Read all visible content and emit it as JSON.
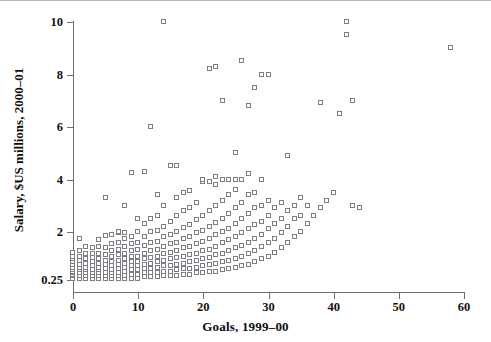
{
  "figure": {
    "kind": "scatter-plot",
    "background_color": "#ffffff",
    "marker_color": "#7d7d84",
    "marker_fill": "#ffffff",
    "axis_color": "#6f6f6f"
  },
  "axes": {
    "x_title": "Goals, 1999–00",
    "y_title": "Salary, $US millions, 2000–01",
    "x_ticks": [
      "0",
      "10",
      "20",
      "30",
      "40",
      "50",
      "60"
    ],
    "y_ticks": [
      "0.25",
      "2",
      "4",
      "6",
      "8",
      "10"
    ]
  },
  "chart_data": {
    "type": "scatter",
    "title": "",
    "xlabel": "Goals, 1999–00",
    "ylabel": "Salary, $US millions, 2000–01",
    "xlim": [
      0,
      60
    ],
    "ylim": [
      0.25,
      10
    ],
    "xticks": [
      0,
      10,
      20,
      30,
      40,
      50,
      60
    ],
    "yticks": [
      0.25,
      2,
      4,
      6,
      8,
      10
    ],
    "y_axis_note": "broken/compressed axis: 0.25 baseline then linear 2 to 10",
    "grid": false,
    "legend": false,
    "marker": "open-square",
    "series": [
      {
        "name": "players",
        "points": [
          [
            0,
            0.3
          ],
          [
            0,
            0.4
          ],
          [
            0,
            0.45
          ],
          [
            0,
            0.5
          ],
          [
            0,
            0.55
          ],
          [
            0,
            0.6
          ],
          [
            0,
            0.7
          ],
          [
            0,
            0.8
          ],
          [
            0,
            0.9
          ],
          [
            0,
            1.0
          ],
          [
            0,
            1.1
          ],
          [
            0,
            1.25
          ],
          [
            1,
            0.3
          ],
          [
            1,
            0.4
          ],
          [
            1,
            0.5
          ],
          [
            1,
            0.6
          ],
          [
            1,
            0.7
          ],
          [
            1,
            0.8
          ],
          [
            1,
            0.95
          ],
          [
            1,
            1.1
          ],
          [
            1,
            1.3
          ],
          [
            1,
            1.75
          ],
          [
            2,
            0.3
          ],
          [
            2,
            0.4
          ],
          [
            2,
            0.5
          ],
          [
            2,
            0.6
          ],
          [
            2,
            0.7
          ],
          [
            2,
            0.85
          ],
          [
            2,
            1.0
          ],
          [
            2,
            1.2
          ],
          [
            2,
            1.45
          ],
          [
            3,
            0.3
          ],
          [
            3,
            0.4
          ],
          [
            3,
            0.5
          ],
          [
            3,
            0.6
          ],
          [
            3,
            0.75
          ],
          [
            3,
            0.9
          ],
          [
            3,
            1.05
          ],
          [
            3,
            1.2
          ],
          [
            3,
            1.4
          ],
          [
            4,
            0.3
          ],
          [
            4,
            0.4
          ],
          [
            4,
            0.5
          ],
          [
            4,
            0.6
          ],
          [
            4,
            0.7
          ],
          [
            4,
            0.85
          ],
          [
            4,
            1.0
          ],
          [
            4,
            1.2
          ],
          [
            4,
            1.45
          ],
          [
            4,
            1.7
          ],
          [
            5,
            0.3
          ],
          [
            5,
            0.4
          ],
          [
            5,
            0.5
          ],
          [
            5,
            0.65
          ],
          [
            5,
            0.8
          ],
          [
            5,
            0.95
          ],
          [
            5,
            1.15
          ],
          [
            5,
            1.4
          ],
          [
            5,
            1.85
          ],
          [
            5,
            3.3
          ],
          [
            6,
            0.3
          ],
          [
            6,
            0.4
          ],
          [
            6,
            0.5
          ],
          [
            6,
            0.6
          ],
          [
            6,
            0.75
          ],
          [
            6,
            0.9
          ],
          [
            6,
            1.1
          ],
          [
            6,
            1.3
          ],
          [
            6,
            1.55
          ],
          [
            6,
            1.9
          ],
          [
            7,
            0.3
          ],
          [
            7,
            0.4
          ],
          [
            7,
            0.5
          ],
          [
            7,
            0.65
          ],
          [
            7,
            0.8
          ],
          [
            7,
            0.95
          ],
          [
            7,
            1.15
          ],
          [
            7,
            1.35
          ],
          [
            7,
            1.6
          ],
          [
            7,
            1.95
          ],
          [
            7,
            2.0
          ],
          [
            8,
            0.3
          ],
          [
            8,
            0.4
          ],
          [
            8,
            0.55
          ],
          [
            8,
            0.7
          ],
          [
            8,
            0.85
          ],
          [
            8,
            1.0
          ],
          [
            8,
            1.2
          ],
          [
            8,
            1.45
          ],
          [
            8,
            1.75
          ],
          [
            8,
            1.95
          ],
          [
            8,
            3.0
          ],
          [
            9,
            0.3
          ],
          [
            9,
            0.45
          ],
          [
            9,
            0.6
          ],
          [
            9,
            0.75
          ],
          [
            9,
            0.9
          ],
          [
            9,
            1.1
          ],
          [
            9,
            1.3
          ],
          [
            9,
            1.55
          ],
          [
            9,
            1.8
          ],
          [
            9,
            4.25
          ],
          [
            10,
            0.3
          ],
          [
            10,
            0.45
          ],
          [
            10,
            0.6
          ],
          [
            10,
            0.75
          ],
          [
            10,
            0.9
          ],
          [
            10,
            1.1
          ],
          [
            10,
            1.35
          ],
          [
            10,
            1.6
          ],
          [
            10,
            2.0
          ],
          [
            10,
            2.5
          ],
          [
            11,
            0.35
          ],
          [
            11,
            0.5
          ],
          [
            11,
            0.65
          ],
          [
            11,
            0.8
          ],
          [
            11,
            1.0
          ],
          [
            11,
            1.2
          ],
          [
            11,
            1.5
          ],
          [
            11,
            1.8
          ],
          [
            11,
            2.3
          ],
          [
            11,
            4.3
          ],
          [
            12,
            0.35
          ],
          [
            12,
            0.5
          ],
          [
            12,
            0.65
          ],
          [
            12,
            0.85
          ],
          [
            12,
            1.05
          ],
          [
            12,
            1.3
          ],
          [
            12,
            1.6
          ],
          [
            12,
            2.0
          ],
          [
            12,
            2.5
          ],
          [
            12,
            6.0
          ],
          [
            13,
            0.35
          ],
          [
            13,
            0.5
          ],
          [
            13,
            0.7
          ],
          [
            13,
            0.9
          ],
          [
            13,
            1.1
          ],
          [
            13,
            1.35
          ],
          [
            13,
            1.65
          ],
          [
            13,
            2.05
          ],
          [
            13,
            2.6
          ],
          [
            13,
            3.4
          ],
          [
            14,
            0.4
          ],
          [
            14,
            0.55
          ],
          [
            14,
            0.75
          ],
          [
            14,
            0.95
          ],
          [
            14,
            1.2
          ],
          [
            14,
            1.45
          ],
          [
            14,
            1.8
          ],
          [
            14,
            2.2
          ],
          [
            14,
            3.0
          ],
          [
            14,
            10.0
          ],
          [
            15,
            0.4
          ],
          [
            15,
            0.55
          ],
          [
            15,
            0.75
          ],
          [
            15,
            1.0
          ],
          [
            15,
            1.25
          ],
          [
            15,
            1.55
          ],
          [
            15,
            1.9
          ],
          [
            15,
            2.4
          ],
          [
            15,
            4.5
          ],
          [
            16,
            0.4
          ],
          [
            16,
            0.6
          ],
          [
            16,
            0.8
          ],
          [
            16,
            1.05
          ],
          [
            16,
            1.3
          ],
          [
            16,
            1.6
          ],
          [
            16,
            2.0
          ],
          [
            16,
            2.6
          ],
          [
            16,
            3.3
          ],
          [
            16,
            4.5
          ],
          [
            17,
            0.45
          ],
          [
            17,
            0.65
          ],
          [
            17,
            0.85
          ],
          [
            17,
            1.1
          ],
          [
            17,
            1.4
          ],
          [
            17,
            1.75
          ],
          [
            17,
            2.15
          ],
          [
            17,
            2.8
          ],
          [
            17,
            3.5
          ],
          [
            18,
            0.45
          ],
          [
            18,
            0.65
          ],
          [
            18,
            0.9
          ],
          [
            18,
            1.15
          ],
          [
            18,
            1.45
          ],
          [
            18,
            1.8
          ],
          [
            18,
            2.25
          ],
          [
            18,
            2.9
          ],
          [
            18,
            3.55
          ],
          [
            19,
            0.5
          ],
          [
            19,
            0.7
          ],
          [
            19,
            0.95
          ],
          [
            19,
            1.2
          ],
          [
            19,
            1.55
          ],
          [
            19,
            1.95
          ],
          [
            19,
            2.45
          ],
          [
            19,
            3.1
          ],
          [
            20,
            0.5
          ],
          [
            20,
            0.75
          ],
          [
            20,
            1.0
          ],
          [
            20,
            1.3
          ],
          [
            20,
            1.65
          ],
          [
            20,
            2.05
          ],
          [
            20,
            2.6
          ],
          [
            20,
            3.9
          ],
          [
            20,
            4.0
          ],
          [
            21,
            0.55
          ],
          [
            21,
            0.8
          ],
          [
            21,
            1.05
          ],
          [
            21,
            1.35
          ],
          [
            21,
            1.75
          ],
          [
            21,
            2.2
          ],
          [
            21,
            2.8
          ],
          [
            21,
            3.9
          ],
          [
            21,
            8.2
          ],
          [
            22,
            0.55
          ],
          [
            22,
            0.85
          ],
          [
            22,
            1.15
          ],
          [
            22,
            1.45
          ],
          [
            22,
            1.9
          ],
          [
            22,
            2.35
          ],
          [
            22,
            3.0
          ],
          [
            22,
            3.8
          ],
          [
            22,
            4.1
          ],
          [
            22,
            8.3
          ],
          [
            23,
            0.6
          ],
          [
            23,
            0.9
          ],
          [
            23,
            1.2
          ],
          [
            23,
            1.6
          ],
          [
            23,
            2.0
          ],
          [
            23,
            2.5
          ],
          [
            23,
            3.2
          ],
          [
            23,
            4.0
          ],
          [
            23,
            7.0
          ],
          [
            24,
            0.65
          ],
          [
            24,
            0.95
          ],
          [
            24,
            1.3
          ],
          [
            24,
            1.7
          ],
          [
            24,
            2.1
          ],
          [
            24,
            2.7
          ],
          [
            24,
            3.4
          ],
          [
            24,
            4.0
          ],
          [
            25,
            0.7
          ],
          [
            25,
            1.0
          ],
          [
            25,
            1.4
          ],
          [
            25,
            1.8
          ],
          [
            25,
            2.3
          ],
          [
            25,
            2.9
          ],
          [
            25,
            3.6
          ],
          [
            25,
            4.0
          ],
          [
            25,
            5.0
          ],
          [
            26,
            0.75
          ],
          [
            26,
            1.1
          ],
          [
            26,
            1.5
          ],
          [
            26,
            1.95
          ],
          [
            26,
            2.5
          ],
          [
            26,
            3.1
          ],
          [
            26,
            4.0
          ],
          [
            26,
            8.5
          ],
          [
            27,
            0.8
          ],
          [
            27,
            1.2
          ],
          [
            27,
            1.6
          ],
          [
            27,
            2.1
          ],
          [
            27,
            2.7
          ],
          [
            27,
            3.4
          ],
          [
            27,
            4.2
          ],
          [
            27,
            6.8
          ],
          [
            28,
            0.9
          ],
          [
            28,
            1.3
          ],
          [
            28,
            1.75
          ],
          [
            28,
            2.25
          ],
          [
            28,
            2.9
          ],
          [
            28,
            3.5
          ],
          [
            28,
            7.5
          ],
          [
            29,
            1.0
          ],
          [
            29,
            1.45
          ],
          [
            29,
            1.9
          ],
          [
            29,
            2.4
          ],
          [
            29,
            3.0
          ],
          [
            29,
            4.0
          ],
          [
            29,
            8.0
          ],
          [
            30,
            1.1
          ],
          [
            30,
            1.6
          ],
          [
            30,
            2.1
          ],
          [
            30,
            2.6
          ],
          [
            30,
            3.2
          ],
          [
            30,
            8.0
          ],
          [
            31,
            1.25
          ],
          [
            31,
            1.75
          ],
          [
            31,
            2.3
          ],
          [
            31,
            2.9
          ],
          [
            32,
            1.4
          ],
          [
            32,
            1.95
          ],
          [
            32,
            2.5
          ],
          [
            32,
            3.1
          ],
          [
            33,
            1.6
          ],
          [
            33,
            2.2
          ],
          [
            33,
            2.8
          ],
          [
            33,
            4.9
          ],
          [
            34,
            1.8
          ],
          [
            34,
            2.5
          ],
          [
            34,
            3.0
          ],
          [
            35,
            2.0
          ],
          [
            35,
            2.6
          ],
          [
            35,
            3.3
          ],
          [
            36,
            2.3
          ],
          [
            36,
            3.0
          ],
          [
            37,
            2.6
          ],
          [
            38,
            2.9
          ],
          [
            38,
            6.9
          ],
          [
            39,
            3.2
          ],
          [
            40,
            3.5
          ],
          [
            41,
            6.5
          ],
          [
            42,
            10.0
          ],
          [
            42,
            9.5
          ],
          [
            43,
            7.0
          ],
          [
            43,
            3.0
          ],
          [
            44,
            2.9
          ],
          [
            58,
            9.0
          ]
        ]
      }
    ]
  }
}
